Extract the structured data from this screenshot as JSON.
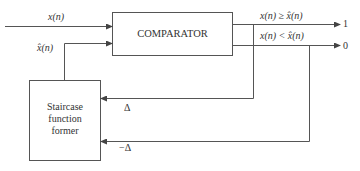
{
  "diagram": {
    "type": "block-diagram",
    "blocks": [
      {
        "id": "comparator",
        "label": "COMPARATOR"
      },
      {
        "id": "staircase",
        "label_lines": [
          "Staircase",
          "function",
          "former"
        ]
      }
    ],
    "signals": {
      "input": "x(n)",
      "estimate": "x̂(n)",
      "cond_ge": "x(n) ≥ x̂(n)",
      "cond_lt": "x(n) < x̂(n)",
      "out_one": "1",
      "out_zero": "0",
      "delta": "Δ",
      "neg_delta": "−Δ"
    },
    "colors": {
      "line": "#555555",
      "text": "#333333",
      "background": "#ffffff"
    }
  }
}
